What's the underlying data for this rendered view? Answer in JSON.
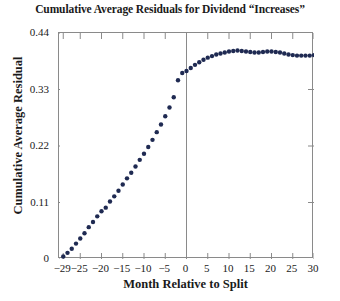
{
  "chart_data": {
    "type": "scatter",
    "title": "Cumulative Average Residuals for Dividend “Increases”",
    "xlabel": "Month Relative to Split",
    "ylabel": "Cumulative Average Residual",
    "xlim": [
      -30,
      30
    ],
    "ylim": [
      0,
      0.44
    ],
    "grid": false,
    "legend": null,
    "marker_color": "#1f2a52",
    "axis_color": "#8a8a8a",
    "reference_line": {
      "axis": "x",
      "value": 0,
      "color": "#8a8a8a"
    },
    "xticks": [
      -29,
      -25,
      -20,
      -15,
      -10,
      -5,
      0,
      5,
      10,
      15,
      20,
      25,
      30
    ],
    "xtick_labels": [
      "−29",
      "−25",
      "−20",
      "−15",
      "−10",
      "−5",
      "0",
      "5",
      "10",
      "15",
      "20",
      "25",
      "30"
    ],
    "yticks": [
      0,
      0.11,
      0.22,
      0.33,
      0.44
    ],
    "ytick_labels": [
      "0",
      "0.11",
      "0.22",
      "0.33",
      "0.44"
    ],
    "x": [
      -29,
      -28,
      -27,
      -26,
      -25,
      -24,
      -23,
      -22,
      -21,
      -20,
      -19,
      -18,
      -17,
      -16,
      -15,
      -14,
      -13,
      -12,
      -11,
      -10,
      -9,
      -8,
      -7,
      -6,
      -5,
      -4,
      -3,
      -2,
      -1,
      0,
      1,
      2,
      3,
      4,
      5,
      6,
      7,
      8,
      9,
      10,
      11,
      12,
      13,
      14,
      15,
      16,
      17,
      18,
      19,
      20,
      21,
      22,
      23,
      24,
      25,
      26,
      27,
      28,
      29,
      30
    ],
    "y": [
      0.005,
      0.012,
      0.02,
      0.03,
      0.04,
      0.05,
      0.062,
      0.072,
      0.083,
      0.093,
      0.1,
      0.112,
      0.122,
      0.133,
      0.145,
      0.157,
      0.168,
      0.18,
      0.193,
      0.205,
      0.218,
      0.232,
      0.247,
      0.262,
      0.278,
      0.295,
      0.315,
      0.348,
      0.362,
      0.366,
      0.372,
      0.378,
      0.383,
      0.388,
      0.392,
      0.395,
      0.398,
      0.4,
      0.402,
      0.404,
      0.405,
      0.406,
      0.405,
      0.404,
      0.403,
      0.402,
      0.402,
      0.403,
      0.404,
      0.404,
      0.403,
      0.402,
      0.4,
      0.398,
      0.397,
      0.396,
      0.396,
      0.396,
      0.396,
      0.397
    ]
  }
}
